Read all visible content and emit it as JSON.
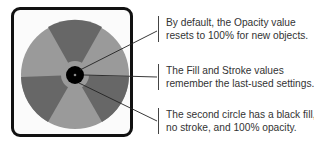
{
  "diagram": {
    "colors": {
      "frame": "#111111",
      "light_segment": "#999999",
      "dark_segment": "#666666",
      "center_circle": "#000000",
      "leader_line": "#222222"
    },
    "callouts": [
      {
        "text": "By default, the Opacity value resets to 100% for new objects."
      },
      {
        "text": "The Fill and Stroke values remember the last-used settings."
      },
      {
        "text": "The second circle has a black fill, no stroke, and 100% opacity."
      }
    ]
  }
}
